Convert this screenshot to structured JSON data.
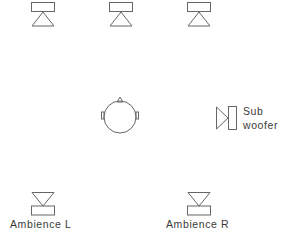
{
  "diagram": {
    "speakers": [
      {
        "id": "front-left",
        "label": ""
      },
      {
        "id": "center",
        "label": ""
      },
      {
        "id": "front-right",
        "label": ""
      },
      {
        "id": "ambience-left",
        "label": "Ambience  L"
      },
      {
        "id": "ambience-right",
        "label": "Ambience  R"
      }
    ],
    "subwoofer": {
      "line1": "Sub",
      "line2": "woofer"
    },
    "listener": {
      "name": "head"
    },
    "stroke_color": "#666666"
  }
}
